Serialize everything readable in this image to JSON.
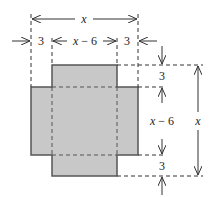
{
  "diagram": {
    "fill_color": "#c8c8c8",
    "stroke_color": "#555555",
    "line_color": "#333333",
    "labels": {
      "top_total": "x",
      "top_left_cut": "3",
      "top_middle": "x − 6",
      "top_right_cut": "3",
      "right_top_cut": "3",
      "right_middle": "x − 6",
      "right_bottom_cut": "3",
      "right_total": "x"
    }
  }
}
